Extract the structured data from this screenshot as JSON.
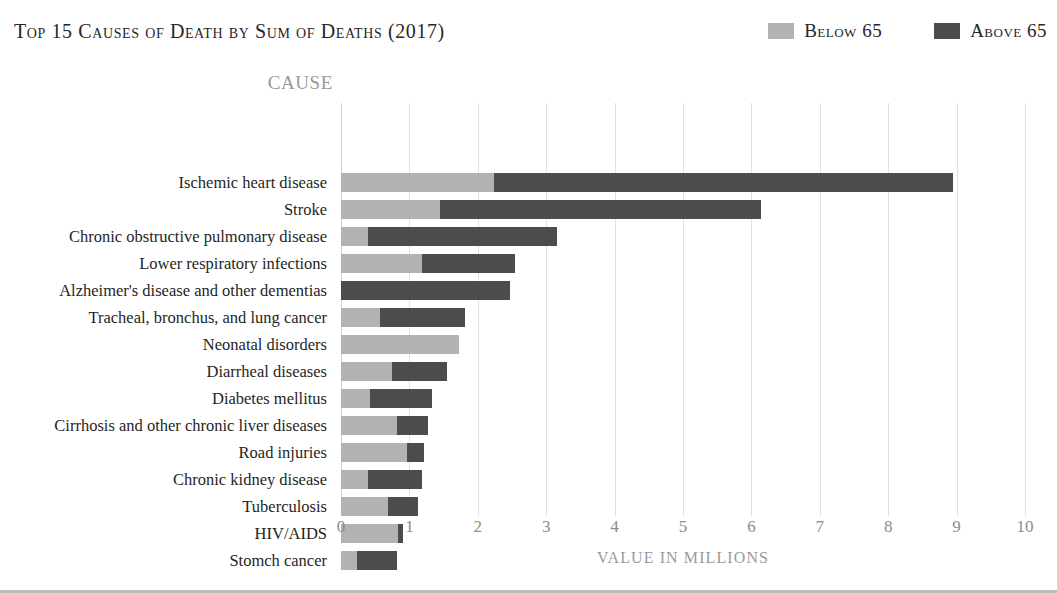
{
  "header": {
    "title": "Top 15 Causes of Death by Sum of Deaths (2017)",
    "legend": [
      {
        "label": "Below 65",
        "color": "#b2b2b2",
        "swatch_name": "legend-swatch-below-65"
      },
      {
        "label": "Above 65",
        "color": "#4c4c4c",
        "swatch_name": "legend-swatch-above-65"
      }
    ]
  },
  "axes": {
    "y_header": "CAUSE",
    "x_title": "VALUE IN MILLIONS",
    "x_ticks": [
      "0",
      "1",
      "2",
      "3",
      "4",
      "5",
      "6",
      "7",
      "8",
      "9",
      "10"
    ]
  },
  "chart_data": {
    "type": "bar",
    "orientation": "horizontal",
    "stacked": true,
    "title": "Top 15 Causes of Death by Sum of Deaths (2017)",
    "xlabel": "VALUE IN MILLIONS",
    "ylabel": "CAUSE",
    "xlim": [
      0,
      10
    ],
    "grid": "vertical",
    "legend_position": "top-right",
    "categories": [
      "Ischemic heart disease",
      "Stroke",
      "Chronic obstructive pulmonary disease",
      "Lower respiratory infections",
      "Alzheimer's disease and other dementias",
      "Tracheal, bronchus, and lung cancer",
      "Neonatal disorders",
      "Diarrheal diseases",
      "Diabetes mellitus",
      "Cirrhosis and other chronic liver diseases",
      "Road injuries",
      "Chronic kidney disease",
      "Tuberculosis",
      "HIV/AIDS",
      "Stomch cancer"
    ],
    "series": [
      {
        "name": "Below 65",
        "color": "#b2b2b2",
        "values": [
          2.24,
          1.45,
          0.4,
          1.19,
          0.0,
          0.57,
          1.73,
          0.75,
          0.42,
          0.82,
          0.96,
          0.4,
          0.69,
          0.83,
          0.23
        ]
      },
      {
        "name": "Above 65",
        "color": "#4c4c4c",
        "values": [
          6.71,
          4.69,
          2.76,
          1.35,
          2.47,
          1.24,
          0.0,
          0.8,
          0.91,
          0.45,
          0.25,
          0.78,
          0.44,
          0.08,
          0.59
        ]
      }
    ],
    "totals": [
      8.95,
      6.14,
      3.16,
      2.54,
      2.47,
      1.81,
      1.73,
      1.55,
      1.33,
      1.27,
      1.21,
      1.18,
      1.13,
      0.91,
      0.82
    ]
  }
}
